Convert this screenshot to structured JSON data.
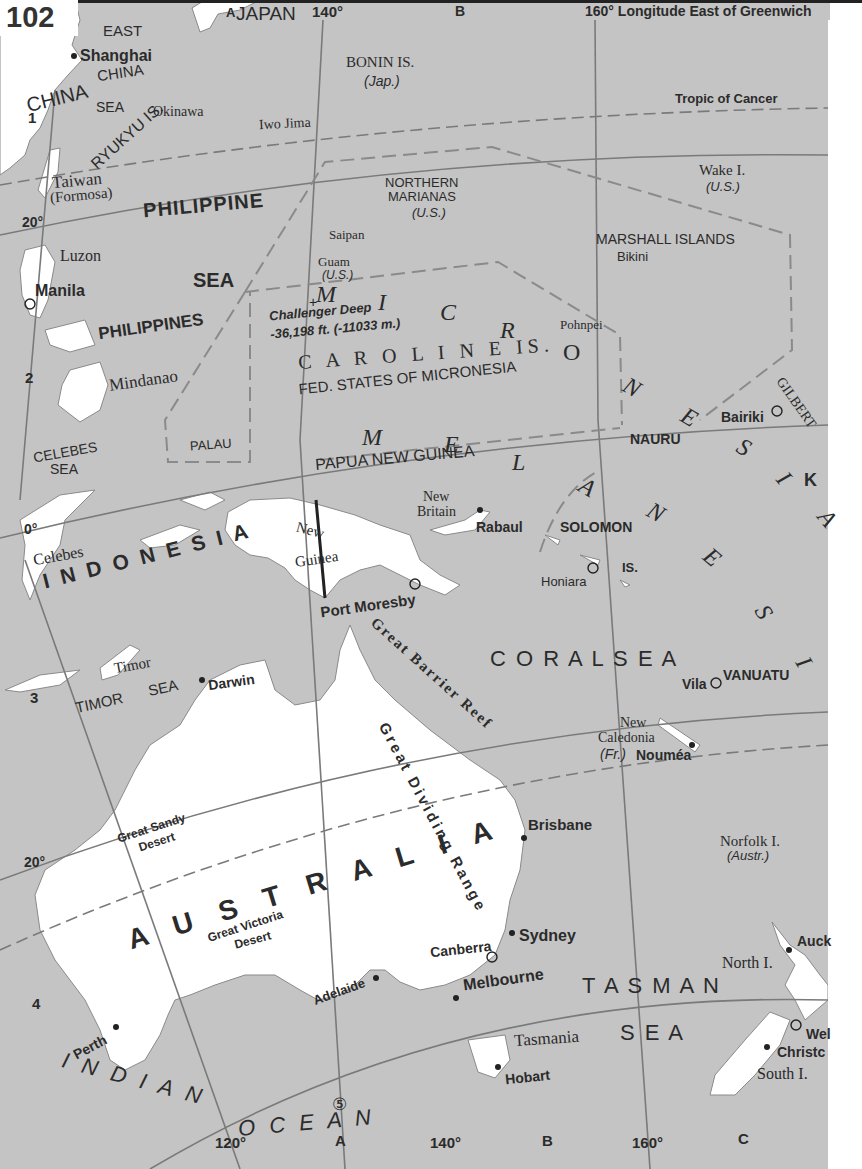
{
  "page": {
    "number": "102",
    "header_longitude": "160° Longitude East of Greenwich",
    "colors": {
      "ocean": "#c4c4c4",
      "land": "#ffffff",
      "grid": "#7a7a7a",
      "boundary": "#8a8a8a",
      "text": "#2b2b2b"
    }
  },
  "grid": {
    "top_columns": [
      "A",
      "B"
    ],
    "bottom_columns": [
      "A",
      "B",
      "C"
    ],
    "rows": [
      "1",
      "2",
      "3",
      "4",
      "5"
    ],
    "longitudes_top": [
      "140°",
      "160°"
    ],
    "longitudes_bottom": [
      "120°",
      "140°",
      "160°"
    ],
    "latitudes": [
      "20°",
      "0°",
      "20°"
    ],
    "tropic_label": "Tropic of Cancer"
  },
  "countries": {
    "china": "CHINA",
    "japan": "JAPAN",
    "philippines": "PHILIPPINES",
    "indonesia": "I N D O N E S I A",
    "papua_new_guinea": "PAPUA NEW GUINEA",
    "australia": "A U S T R A L I A",
    "nauru": "NAURU",
    "vanuatu": "VANUATU",
    "solomon": "SOLOMON",
    "solomon_is": "IS.",
    "palau": "PALAU",
    "fsm": "FED. STATES OF MICRONESIA",
    "marshall": "MARSHALL ISLANDS",
    "gilbert": "GILBERT",
    "kiribati_k": "K"
  },
  "regions": {
    "micronesia": [
      "M",
      "I",
      "C",
      "R",
      "O",
      "N",
      "E",
      "S",
      "I",
      "A"
    ],
    "melanesia": [
      "M",
      "E",
      "L",
      "A",
      "N",
      "E",
      "S",
      "I",
      "A"
    ]
  },
  "seas": {
    "east_china_sea": [
      "EAST",
      "CHINA",
      "SEA"
    ],
    "philippine_sea": [
      "PHILIPPINE",
      "SEA"
    ],
    "celebes_sea": [
      "CELEBES",
      "SEA"
    ],
    "timor_sea": [
      "TIMOR",
      "SEA"
    ],
    "coral_sea": "C O R A L   S E A",
    "tasman_sea": [
      "T A S M A N",
      "S E A"
    ],
    "indian_ocean": [
      "I N D I A N",
      "O C E A N"
    ]
  },
  "islands": {
    "ryukyu": "RYUKYU IS.",
    "okinawa": "Okinawa",
    "iwo_jima": "Iwo Jima",
    "bonin": "BONIN IS.",
    "bonin_owner": "(Jap.)",
    "taiwan": "Taiwan",
    "formosa": "(Formosa)",
    "northern_marianas": [
      "NORTHERN",
      "MARIANAS",
      "(U.S.)"
    ],
    "saipan": "Saipan",
    "guam": "Guam",
    "guam_owner": "(U.S.)",
    "wake": "Wake I.",
    "wake_owner": "(U.S.)",
    "bikini": "Bikini",
    "luzon": "Luzon",
    "mindanao": "Mindanao",
    "caroline": "C A R O L I N E  IS.",
    "pohnpei": "Pohnpei",
    "celebes": "Celebes",
    "new_guinea": [
      "New",
      "Guinea"
    ],
    "new_britain": [
      "New",
      "Britain"
    ],
    "timor": "Timor",
    "new_caledonia": [
      "New",
      "Caledonia",
      "(Fr.)"
    ],
    "norfolk": "Norfolk I.",
    "norfolk_owner": "(Austr.)",
    "tasmania": "Tasmania",
    "north_island": "North I.",
    "south_island": "South I."
  },
  "features": {
    "challenger_deep": "Challenger Deep",
    "challenger_depth": "-36,198 ft. (-11033 m.)",
    "great_sandy": [
      "Great Sandy",
      "Desert"
    ],
    "great_victoria": [
      "Great Victoria",
      "Desert"
    ],
    "great_barrier_reef": "Great Barrier Reef",
    "great_dividing_range": "Great Dividing Range",
    "circled_5": "⑤"
  },
  "cities": {
    "shanghai": "Shanghai",
    "manila": "Manila",
    "port_moresby": "Port Moresby",
    "rabaul": "Rabaul",
    "honiara": "Honiara",
    "bairiki": "Bairiki",
    "vila": "Vila",
    "noumea": "Nouméa",
    "darwin": "Darwin",
    "brisbane": "Brisbane",
    "sydney": "Sydney",
    "canberra": "Canberra",
    "melbourne": "Melbourne",
    "adelaide": "Adelaide",
    "perth": "Perth",
    "hobart": "Hobart",
    "auckland": "Auck",
    "wellington": "Wel",
    "christchurch": "Christc"
  }
}
